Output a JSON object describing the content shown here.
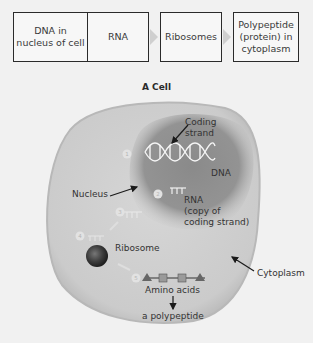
{
  "flowchart": {
    "steps": [
      {
        "label": "DNA in nucleus of cell"
      },
      {
        "label": "RNA"
      },
      {
        "label": "Ribosomes"
      },
      {
        "label": "Polypeptide (protein) in cytoplasm"
      }
    ]
  },
  "diagram": {
    "title": "A Cell",
    "labels": {
      "coding_strand_1": "Coding",
      "coding_strand_2": "strand",
      "dna": "DNA",
      "nucleus": "Nucleus",
      "rna_1": "RNA",
      "rna_2": "(copy of",
      "rna_3": "coding strand)",
      "ribosome": "Ribosome",
      "cytoplasm": "Cytoplasm",
      "amino_acids": "Amino acids",
      "polypeptide": "a polypeptide"
    },
    "step_numbers": [
      "1",
      "2",
      "3",
      "4",
      "5"
    ],
    "colors": {
      "background": "#f1f1f1",
      "cell": "#cdcdcd",
      "cell_edge": "#b5b5b5",
      "nucleus": "#8f8f8f",
      "ribosome": "#3a3a3a",
      "box_border": "#2b2b2b"
    }
  }
}
